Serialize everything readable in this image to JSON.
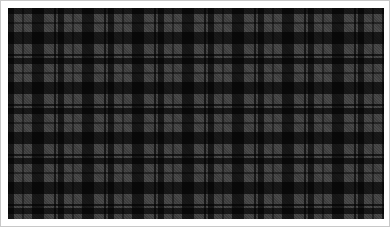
{
  "image": {
    "subject": "Grayscale tartan plaid fabric pattern",
    "width": 390,
    "height": 227
  },
  "colors": {
    "margin": "#ffffff",
    "border": "#c8c8c8",
    "base_gray": "#8f8f8f",
    "dark": "#1a1a1a",
    "mid_dark": "#4a4a4a",
    "light": "#a8a8a8"
  },
  "sett": {
    "repeat_x_px": 50,
    "repeat_y_px": 50,
    "stripes": [
      {
        "color": "dark",
        "start": 0,
        "end": 6
      },
      {
        "color": "light",
        "start": 6,
        "end": 14
      },
      {
        "color": "mid_dark",
        "start": 14,
        "end": 16
      },
      {
        "color": "light",
        "start": 16,
        "end": 24
      },
      {
        "color": "dark",
        "start": 24,
        "end": 36
      },
      {
        "color": "light",
        "start": 36,
        "end": 46
      },
      {
        "color": "dark",
        "start": 46,
        "end": 48
      },
      {
        "color": "light",
        "start": 48,
        "end": 50
      }
    ]
  }
}
